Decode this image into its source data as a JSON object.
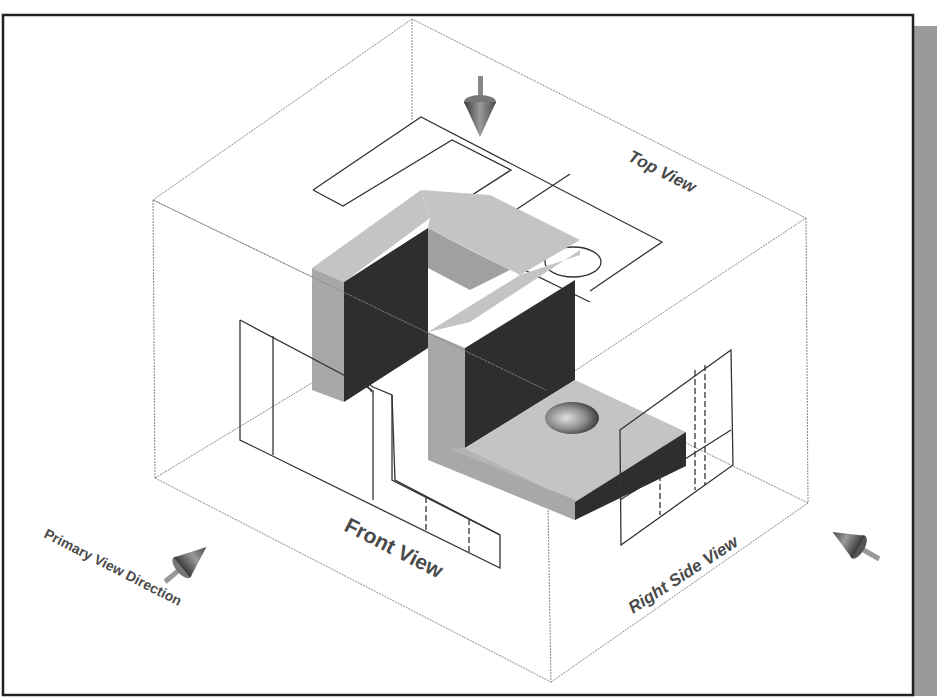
{
  "figure": {
    "labels": {
      "top_view": "Top View",
      "front_view": "Front View",
      "right_side_view": "Right Side View",
      "primary_view_direction": "Primary View Direction"
    },
    "arrows": [
      {
        "name": "top-view-arrow",
        "direction": "down"
      },
      {
        "name": "primary-view-arrow",
        "direction": "up-right"
      },
      {
        "name": "right-side-view-arrow",
        "direction": "up-left"
      }
    ],
    "colors": {
      "frame_border": "#222222",
      "frame_shadow": "#9a9a9a",
      "box_lines": "#888888",
      "projection_lines": "#333333",
      "face_light": "#c4c4c4",
      "face_mid": "#a8a8a8",
      "face_dark": "#2e2e2e",
      "label_text": "#4a4a4a"
    }
  }
}
